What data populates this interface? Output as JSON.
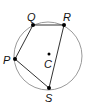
{
  "diagram": {
    "type": "circle-inscribed-quadrilateral",
    "circle": {
      "center_label": "C",
      "cx": 48,
      "cy": 56,
      "r": 34,
      "stroke": "#9a9a9a"
    },
    "points": [
      {
        "label": "P",
        "x": 15,
        "y": 59,
        "label_x": 3,
        "label_y": 64
      },
      {
        "label": "Q",
        "x": 33,
        "y": 25,
        "label_x": 27,
        "label_y": 21
      },
      {
        "label": "R",
        "x": 64,
        "y": 25,
        "label_x": 63,
        "label_y": 21
      },
      {
        "label": "S",
        "x": 49,
        "y": 88,
        "label_x": 45,
        "label_y": 102
      }
    ],
    "center": {
      "label": "C",
      "x": 49,
      "y": 54,
      "label_x": 44,
      "label_y": 68
    },
    "segments": [
      [
        "P",
        "Q"
      ],
      [
        "Q",
        "R"
      ],
      [
        "R",
        "S"
      ],
      [
        "S",
        "P"
      ]
    ],
    "line_color": "#333333"
  }
}
